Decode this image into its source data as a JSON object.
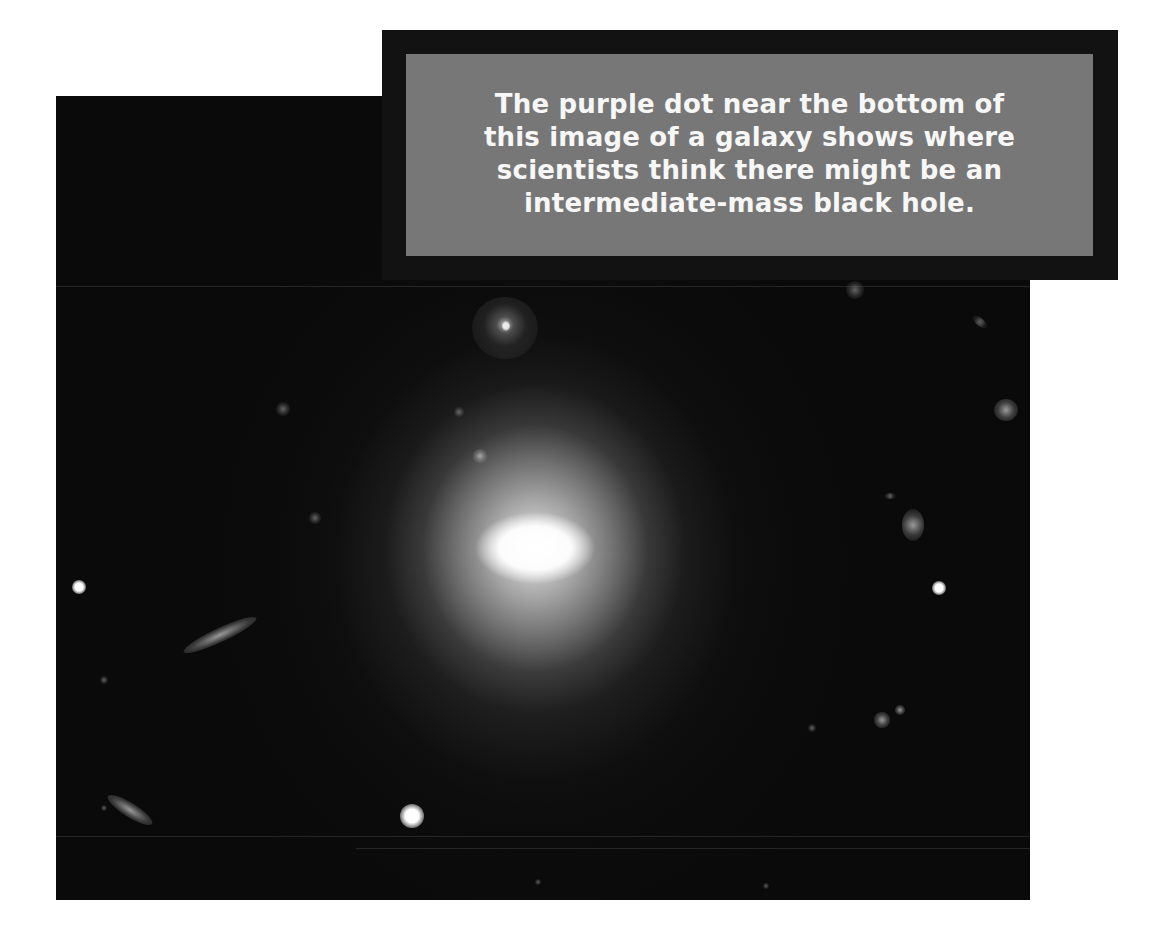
{
  "caption": {
    "lines": [
      "The purple dot near the bottom of",
      "this image of a galaxy shows where",
      "scientists think there might be an",
      "intermediate-mass black hole."
    ],
    "text": "The purple dot near the bottom of this image of a galaxy shows where scientists think there might be an intermediate-mass black hole.",
    "colors": {
      "frame": "#121212",
      "box": "#777777",
      "text": "#f7f7f7"
    }
  },
  "image": {
    "subject": "galaxy",
    "background_color": "#0a0a0a",
    "objects": [
      {
        "name": "central-elliptical-galaxy",
        "x": 535,
        "y": 548
      },
      {
        "name": "spiral-galaxy",
        "x": 505,
        "y": 328
      },
      {
        "name": "bright-star-bottom",
        "x": 412,
        "y": 816
      },
      {
        "name": "bright-star-left",
        "x": 79,
        "y": 587
      },
      {
        "name": "bright-star-right",
        "x": 939,
        "y": 588
      },
      {
        "name": "elliptical-galaxy-right",
        "x": 913,
        "y": 525
      },
      {
        "name": "edge-on-galaxy-left",
        "x": 220,
        "y": 635
      },
      {
        "name": "edge-on-galaxy-bottom-left",
        "x": 130,
        "y": 810
      }
    ]
  }
}
